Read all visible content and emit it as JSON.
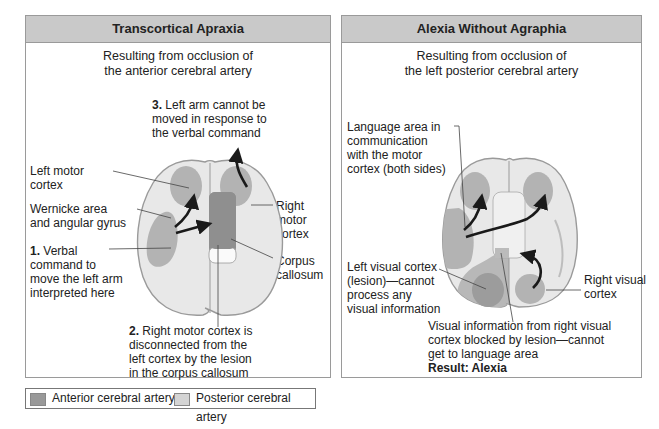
{
  "colors": {
    "header_bg": "#c9c9c9",
    "border": "#9a9a9a",
    "brain_fill": "#e6e6e6",
    "brain_outline": "#9a9a9a",
    "region_mid": "#b2b2b2",
    "anterior_artery": "#999999",
    "posterior_artery": "#d4d4d4",
    "arrow": "#1a1a1a"
  },
  "left_panel": {
    "title": "Transcortical Apraxia",
    "subtitle_line1": "Resulting from occlusion of",
    "subtitle_line2": "the anterior cerebral artery",
    "step3_num": "3.",
    "step3_line1": " Left arm cannot be",
    "step3_line2": "moved in response to",
    "step3_line3": "the verbal command",
    "left_motor_line1": "Left motor",
    "left_motor_line2": "cortex",
    "wernicke_line1": "Wernicke area",
    "wernicke_line2": "and angular gyrus",
    "step1_num": "1.",
    "step1_line1": " Verbal",
    "step1_line2": "command to",
    "step1_line3": "move the left arm",
    "step1_line4": "interpreted here",
    "right_motor_line1": "Right",
    "right_motor_line2": "motor",
    "right_motor_line3": "cortex",
    "corpus_line1": "Corpus",
    "corpus_line2": "callosum",
    "step2_num": "2.",
    "step2_line1": " Right motor cortex is",
    "step2_line2": "disconnected from the",
    "step2_line3": "left cortex by the lesion",
    "step2_line4": "in the corpus callosum"
  },
  "right_panel": {
    "title": "Alexia Without Agraphia",
    "subtitle_line1": "Resulting from occlusion of",
    "subtitle_line2": "the left posterior cerebral artery",
    "language_line1": "Language area in",
    "language_line2": "communication",
    "language_line3": "with the motor",
    "language_line4": "cortex (both sides)",
    "left_visual_line1": "Left visual cortex",
    "left_visual_line2": "(lesion)—cannot",
    "left_visual_line3": "process any",
    "left_visual_line4": "visual information",
    "right_visual_line1": "Right visual",
    "right_visual_line2": "cortex",
    "blocked_line1": "Visual information from right visual",
    "blocked_line2": "cortex blocked by lesion—cannot",
    "blocked_line3": "get to language area",
    "result": "Result: Alexia"
  },
  "legend": {
    "items": [
      {
        "label": "Anterior cerebral artery",
        "color": "#999999"
      },
      {
        "label": "Posterior cerebral artery",
        "color": "#d4d4d4"
      }
    ]
  }
}
